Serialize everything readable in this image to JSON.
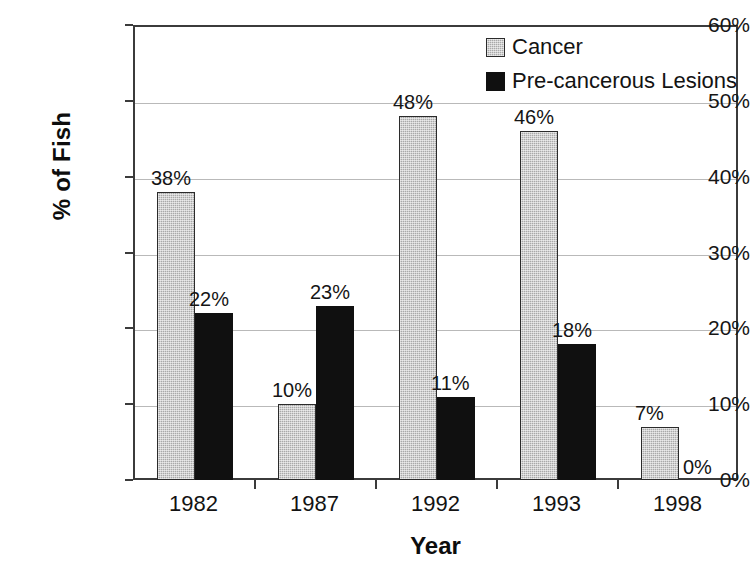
{
  "chart_data": {
    "type": "bar",
    "title": "",
    "xlabel": "Year",
    "ylabel": "% of Fish",
    "categories": [
      "1982",
      "1987",
      "1992",
      "1993",
      "1998"
    ],
    "series": [
      {
        "name": "Cancer",
        "color": "#a9a9a9",
        "values": [
          38,
          10,
          48,
          46,
          7
        ],
        "labels": [
          "38%",
          "10%",
          "48%",
          "46%",
          "7%"
        ]
      },
      {
        "name": "Pre-cancerous Lesions",
        "color": "#101010",
        "values": [
          22,
          23,
          11,
          18,
          0
        ],
        "labels": [
          "22%",
          "23%",
          "11%",
          "18%",
          "0%"
        ]
      }
    ],
    "ylim": [
      0,
      60
    ],
    "ytick_values": [
      0,
      10,
      20,
      30,
      40,
      50,
      60
    ],
    "ytick_labels": [
      "0%",
      "10%",
      "20%",
      "30%",
      "40%",
      "50%",
      "60%"
    ],
    "grid": true,
    "legend_position": "top-right"
  },
  "axes": {
    "y_title": "% of Fish",
    "x_title": "Year"
  },
  "legend": {
    "items": [
      {
        "label": "Cancer",
        "swatch": "gray-hatched-swatch"
      },
      {
        "label": "Pre-cancerous Lesions",
        "swatch": "black-solid-swatch"
      }
    ]
  }
}
